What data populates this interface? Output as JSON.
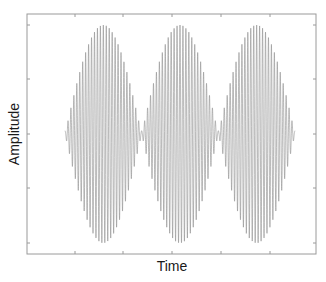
{
  "chart_data": {
    "type": "line",
    "title": "",
    "xlabel": "Time",
    "ylabel": "Amplitude",
    "xticks_count": 5,
    "yticks_count": 5,
    "tick_labels_visible": false,
    "grid": false,
    "legend": null,
    "series": [
      {
        "name": "beat signal",
        "description": "Amplitude-modulated sinusoid: high-frequency carrier inside a rectified sine envelope producing three lobes",
        "envelope_lobes": 3,
        "carrier_cycles_per_lobe": 26,
        "peak_amplitude": 1.0,
        "envelope_min_amplitude": 0.03,
        "color": "#8c8c8c"
      }
    ],
    "xlim": [
      0,
      1
    ],
    "ylim": [
      -1.08,
      1.08
    ]
  },
  "colors": {
    "axis": "#9a9a9a",
    "line": "#8c8c8c",
    "background": "#ffffff"
  }
}
